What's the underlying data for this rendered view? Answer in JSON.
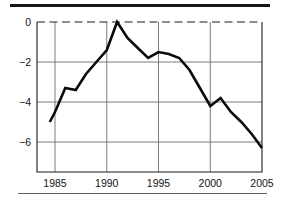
{
  "figure": {
    "background": "#ffffff",
    "top_rule_color": "#161616",
    "bottom_rule_color": "#606060"
  },
  "chart_data": {
    "type": "line",
    "title": "",
    "xlabel": "",
    "ylabel": "",
    "x": [
      1984.5,
      1985,
      1986,
      1987,
      1988,
      1989,
      1990,
      1991,
      1992,
      1993,
      1994,
      1995,
      1996,
      1997,
      1998,
      1999,
      2000,
      2001,
      2002,
      2003,
      2004,
      2005
    ],
    "series": [
      {
        "name": "series-1",
        "values": [
          -5.0,
          -4.5,
          -3.3,
          -3.4,
          -2.6,
          -2.0,
          -1.4,
          0.0,
          -0.8,
          -1.3,
          -1.8,
          -1.5,
          -1.6,
          -1.8,
          -2.4,
          -3.3,
          -4.2,
          -3.8,
          -4.5,
          -5.0,
          -5.6,
          -6.3
        ]
      }
    ],
    "x_ticks": [
      1985,
      1990,
      1995,
      2000,
      2005
    ],
    "x_tick_labels": [
      "1985",
      "1990",
      "1995",
      "2000",
      "2005"
    ],
    "y_ticks": [
      0,
      -2,
      -4,
      -6
    ],
    "y_tick_labels": [
      "0",
      "−2",
      "−4",
      "−6"
    ],
    "xlim_years": [
      1983.3,
      2005
    ],
    "ylim": [
      -7.5,
      0
    ],
    "grid": true,
    "legend": "none",
    "zero_line_style": "dashed",
    "line_color": "#0b0b0b",
    "grid_color": "#6e6e6e",
    "axis_color": "#1c1c1c",
    "label_color": "#141414"
  }
}
